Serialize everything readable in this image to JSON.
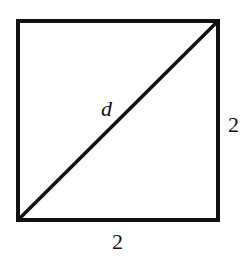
{
  "figure": {
    "shape": "square",
    "diagonal_label": "d",
    "right_side_label": "2",
    "bottom_side_label": "2",
    "stroke_color": "#111111",
    "background": "#ffffff"
  }
}
